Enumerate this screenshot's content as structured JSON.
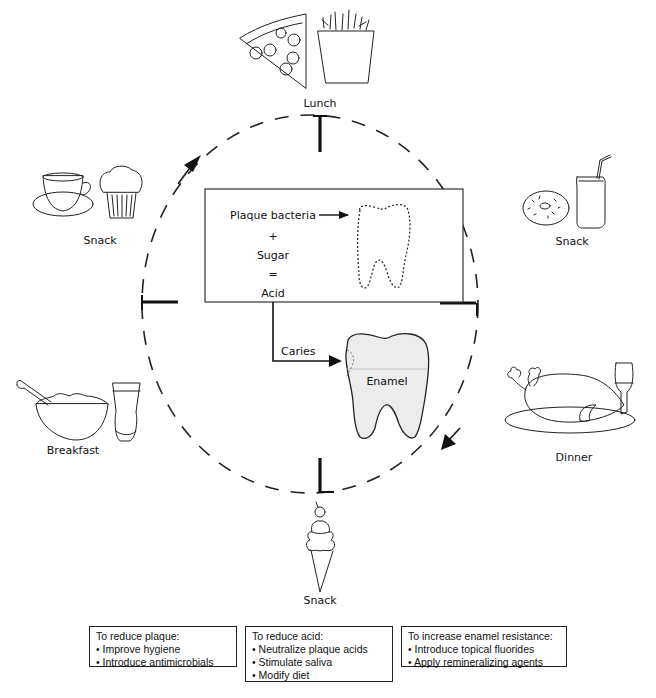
{
  "meals": [
    {
      "id": "lunch",
      "label": "Lunch",
      "icons": [
        "pizza-slice-icon",
        "french-fries-icon"
      ]
    },
    {
      "id": "snack-afternoon",
      "label": "Snack",
      "icons": [
        "donut-icon",
        "soda-can-icon"
      ]
    },
    {
      "id": "dinner",
      "label": "Dinner",
      "icons": [
        "roast-turkey-icon",
        "wine-glass-icon"
      ]
    },
    {
      "id": "snack-evening",
      "label": "Snack",
      "icons": [
        "ice-cream-cone-icon"
      ]
    },
    {
      "id": "breakfast",
      "label": "Breakfast",
      "icons": [
        "cereal-bowl-icon",
        "juice-glass-icon"
      ]
    },
    {
      "id": "snack-morning",
      "label": "Snack",
      "icons": [
        "coffee-cup-icon",
        "muffin-icon"
      ]
    }
  ],
  "center_box": {
    "line1": "Plaque bacteria",
    "line2": "+",
    "line3": "Sugar",
    "line4": "=",
    "line5": "Acid"
  },
  "caries_label": "Caries",
  "enamel_label": "Enamel",
  "cycle": {
    "direction": "clockwise",
    "style": "dashed"
  },
  "interventions": [
    {
      "title": "To reduce plaque:",
      "items": [
        "Improve hygiene",
        "Introduce antimicrobials"
      ]
    },
    {
      "title": "To reduce acid:",
      "items": [
        "Neutralize plaque acids",
        "Stimulate saliva",
        "Modify diet"
      ]
    },
    {
      "title": "To increase enamel resistance:",
      "items": [
        "Introduce topical fluorides",
        "Apply remineralizing agents"
      ]
    }
  ],
  "colors": {
    "ink": "#222222",
    "tooth_fill": "#ececec",
    "background": "#ffffff"
  }
}
